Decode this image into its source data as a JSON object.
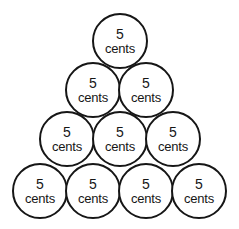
{
  "figure": {
    "shape": "triangle",
    "coin_shape": "circle",
    "total_coins": 10,
    "outline_color": "#161616",
    "fill_color": "#ffffff",
    "text_color": "#161616",
    "background_color": "#ffffff"
  },
  "rows": [
    {
      "index": 0,
      "count": 1,
      "coins": [
        {
          "amount": "5",
          "unit": "cents",
          "x": 92,
          "y": 13
        }
      ]
    },
    {
      "index": 1,
      "count": 2,
      "coins": [
        {
          "amount": "5",
          "unit": "cents",
          "x": 65,
          "y": 62
        },
        {
          "amount": "5",
          "unit": "cents",
          "x": 118,
          "y": 62
        }
      ]
    },
    {
      "index": 2,
      "count": 3,
      "coins": [
        {
          "amount": "5",
          "unit": "cents",
          "x": 39,
          "y": 111
        },
        {
          "amount": "5",
          "unit": "cents",
          "x": 92,
          "y": 111
        },
        {
          "amount": "5",
          "unit": "cents",
          "x": 145,
          "y": 111
        }
      ]
    },
    {
      "index": 3,
      "count": 4,
      "coins": [
        {
          "amount": "5",
          "unit": "cents",
          "x": 12,
          "y": 163
        },
        {
          "amount": "5",
          "unit": "cents",
          "x": 65,
          "y": 163
        },
        {
          "amount": "5",
          "unit": "cents",
          "x": 118,
          "y": 163
        },
        {
          "amount": "5",
          "unit": "cents",
          "x": 171,
          "y": 163
        }
      ]
    }
  ]
}
